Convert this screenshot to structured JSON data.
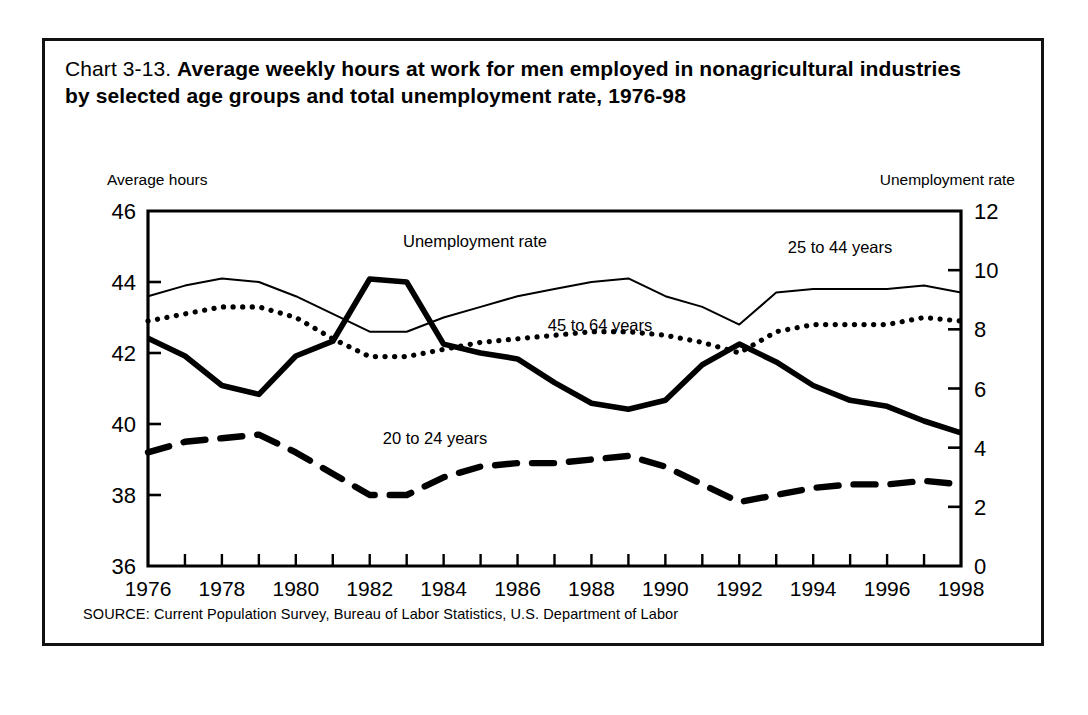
{
  "title": {
    "lead": "Chart 3-13.",
    "bold": "Average weekly hours at work for men employed in nonagricultural industries by selected age groups and total unemployment  rate, 1976-98"
  },
  "left_axis_caption": "Average hours",
  "right_axis_caption": "Unemployment rate",
  "source": "SOURCE: Current Population Survey, Bureau of Labor Statistics, U.S. Department of Labor",
  "series_labels": {
    "unemployment": "Unemployment rate",
    "age_25_44": "25 to 44 years",
    "age_45_64": "45 to 64 years",
    "age_20_24": "20 to 24 years"
  },
  "colors": {
    "ink": "#000000",
    "background": "#ffffff"
  },
  "chart_data": {
    "type": "line",
    "title": "Chart 3-13. Average weekly hours at work for men employed in nonagricultural industries by selected age groups and total unemployment  rate, 1976-98",
    "xlabel": "",
    "ylabel": "Average hours",
    "y2label": "Unemployment rate",
    "xlim": [
      1976,
      1998
    ],
    "ylim": [
      36,
      46
    ],
    "y2lim": [
      0,
      12
    ],
    "yticks": [
      36,
      38,
      40,
      42,
      44,
      46
    ],
    "y2ticks": [
      0,
      2,
      4,
      6,
      8,
      10,
      12
    ],
    "xticks": [
      1976,
      1978,
      1980,
      1982,
      1984,
      1986,
      1988,
      1990,
      1992,
      1994,
      1996,
      1998
    ],
    "x_minor_ticks": [
      1977,
      1979,
      1981,
      1983,
      1985,
      1987,
      1989,
      1991,
      1993,
      1995,
      1997
    ],
    "grid": false,
    "legend": "inline-annotations",
    "x": [
      1976,
      1977,
      1978,
      1979,
      1980,
      1981,
      1982,
      1983,
      1984,
      1985,
      1986,
      1987,
      1988,
      1989,
      1990,
      1991,
      1992,
      1993,
      1994,
      1995,
      1996,
      1997,
      1998
    ],
    "series": [
      {
        "name": "25 to 44 years",
        "axis": "left",
        "style": "thin-solid",
        "units": "average weekly hours",
        "values": [
          43.6,
          43.9,
          44.1,
          44.0,
          43.6,
          43.1,
          42.6,
          42.6,
          43.0,
          43.3,
          43.6,
          43.8,
          44.0,
          44.1,
          43.6,
          43.3,
          42.8,
          43.7,
          43.8,
          43.8,
          43.8,
          43.9,
          43.7
        ]
      },
      {
        "name": "45 to 64 years",
        "axis": "left",
        "style": "dotted",
        "units": "average weekly hours",
        "values": [
          42.9,
          43.1,
          43.3,
          43.3,
          43.0,
          42.4,
          41.9,
          41.9,
          42.1,
          42.3,
          42.4,
          42.5,
          42.6,
          42.6,
          42.5,
          42.3,
          42.0,
          42.6,
          42.8,
          42.8,
          42.8,
          43.0,
          42.9
        ]
      },
      {
        "name": "20 to 24 years",
        "axis": "left",
        "style": "dashed",
        "units": "average weekly hours",
        "values": [
          39.2,
          39.5,
          39.6,
          39.7,
          39.2,
          38.6,
          38.0,
          38.0,
          38.5,
          38.8,
          38.9,
          38.9,
          39.0,
          39.1,
          38.8,
          38.3,
          37.8,
          38.0,
          38.2,
          38.3,
          38.3,
          38.4,
          38.3
        ]
      },
      {
        "name": "Unemployment rate",
        "axis": "right",
        "style": "thick-solid",
        "units": "percent",
        "values": [
          7.7,
          7.1,
          6.1,
          5.8,
          7.1,
          7.6,
          9.7,
          9.6,
          7.5,
          7.2,
          7.0,
          6.2,
          5.5,
          5.3,
          5.6,
          6.8,
          7.5,
          6.9,
          6.1,
          5.6,
          5.4,
          4.9,
          4.5
        ]
      }
    ],
    "annotations": [
      {
        "text": "Unemployment rate",
        "x": 1982,
        "y_axis": "right",
        "placement": "above-peak"
      },
      {
        "text": "25 to 44 years",
        "x": 1995,
        "y_axis": "left",
        "placement": "above-line"
      },
      {
        "text": "45 to 64 years",
        "x": 1987,
        "y_axis": "left",
        "placement": "below-line"
      },
      {
        "text": "20 to 24 years",
        "x": 1983.5,
        "y_axis": "left",
        "placement": "above-line"
      }
    ]
  }
}
